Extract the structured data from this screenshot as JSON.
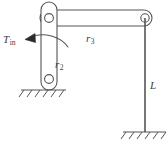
{
  "diagram": {
    "type": "mechanism-schematic",
    "stroke_color": "#555555",
    "fill_color": "#ffffff",
    "text_color": "#3b3b3b",
    "background": "#ffffff",
    "labels": {
      "torque": {
        "base": "T",
        "sub": "in",
        "meaning": "input-torque"
      },
      "link2": {
        "base": "r",
        "sub": "2",
        "meaning": "link-length-2"
      },
      "link3": {
        "base": "r",
        "sub": "3",
        "meaning": "link-length-3"
      },
      "length": {
        "base": "L",
        "sub": "",
        "meaning": "vertical-member-length"
      }
    },
    "elements": {
      "crank_link": "vertical rounded bar with pin joints at both ends",
      "coupler_link": "horizontal rounded bar spanning to right pin",
      "vertical_member": "thin vertical line of length L",
      "ground_left": "hatched ground support under lower crank pivot",
      "ground_right": "hatched ground support under vertical member",
      "torque_arrow": "curved arrow with solid arrowhead indicating applied torque direction"
    }
  }
}
